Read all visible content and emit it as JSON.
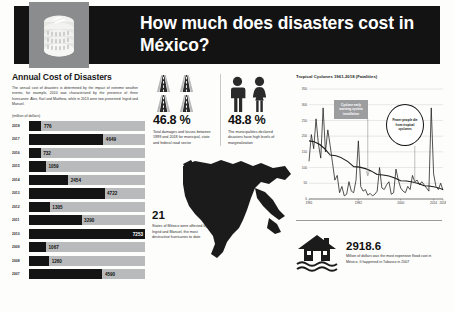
{
  "header": {
    "title": "How much does disasters cost in México?",
    "icon": "coin-stack-icon"
  },
  "left": {
    "section_title": "Annual Cost of Disasters",
    "paragraph": "The annual cost of disasters is determined by the impact of extreme weather events, for example, 2010 was characterized by the presence of three hurricanes: Alex, Karl and Matthew, while in 2013 were two presented: Ingrid and Manuel.",
    "units_label": "(million of dollars)",
    "accent_bar": "#141414",
    "track_color": "#b9babb"
  },
  "chart_data": [
    {
      "type": "bar",
      "title": "Annual Cost of Disasters",
      "ylabel": "",
      "xlabel": "(million of dollars)",
      "orientation": "horizontal",
      "xlim": [
        0,
        7253
      ],
      "grid": false,
      "categories": [
        "2018",
        "2017",
        "2016",
        "2015",
        "2014",
        "2013",
        "2012",
        "2011",
        "2010",
        "2009",
        "2008",
        "2007"
      ],
      "values": [
        776,
        4649,
        732,
        1059,
        2454,
        4722,
        1305,
        3290,
        7253,
        1067,
        1260,
        4590
      ]
    },
    {
      "type": "line",
      "title": "Tropical Cyclones 1961-2018 (Fatalities)",
      "ylabel": "",
      "xlabel": "",
      "ylim": [
        0,
        350
      ],
      "yticks": [
        0,
        50,
        100,
        150,
        200,
        250,
        300,
        350
      ],
      "xticks": [
        "1961",
        "1982",
        "2000",
        "2014",
        "2018"
      ],
      "grid": true,
      "series": [
        {
          "name": "Fatalities",
          "x": [
            1961,
            1962,
            1963,
            1964,
            1965,
            1966,
            1967,
            1968,
            1969,
            1970,
            1971,
            1972,
            1973,
            1974,
            1975,
            1976,
            1977,
            1978,
            1979,
            1980,
            1981,
            1982,
            1983,
            1984,
            1985,
            1986,
            1987,
            1988,
            1989,
            1990,
            1991,
            1992,
            1993,
            1994,
            1995,
            1996,
            1997,
            1998,
            1999,
            2000,
            2001,
            2002,
            2003,
            2004,
            2005,
            2006,
            2007,
            2008,
            2009,
            2010,
            2011,
            2012,
            2013,
            2014,
            2015,
            2016,
            2017,
            2018
          ],
          "values": [
            120,
            205,
            160,
            255,
            175,
            130,
            290,
            150,
            220,
            170,
            115,
            60,
            75,
            20,
            40,
            10,
            15,
            55,
            25,
            20,
            60,
            185,
            40,
            25,
            30,
            12,
            18,
            10,
            15,
            25,
            100,
            35,
            30,
            45,
            55,
            15,
            20,
            95,
            60,
            35,
            25,
            20,
            40,
            30,
            75,
            55,
            60,
            45,
            55,
            45,
            35,
            25,
            290,
            80,
            40,
            30,
            50,
            28
          ]
        },
        {
          "name": "Trend",
          "x": [
            1961,
            1970,
            1980,
            1990,
            2000,
            2010,
            2018
          ],
          "values": [
            185,
            140,
            103,
            78,
            58,
            42,
            30
          ]
        }
      ],
      "annotations": [
        {
          "text": "Cyclone early warning system installation",
          "style": "gray-box",
          "x_year": 1986
        },
        {
          "text": "Fewer people die from tropical cyclones",
          "style": "circle",
          "x_year": 2006
        }
      ]
    }
  ],
  "middle": {
    "stats": [
      {
        "icon": "road-icon",
        "value": "46.8 %",
        "caption": "Total damages and losses between 1999 and 2018 for municipal, state and federal road sector"
      },
      {
        "icon": "people-icon",
        "value": "48.8 %",
        "caption": "The municipalities declared disasters have high levels of marginalization"
      }
    ],
    "map": {
      "icon": "mexico-map-icon",
      "value": "21",
      "caption": "States of México were affected by Ingrid and Manuel, the most destructive hurricanes to date"
    }
  },
  "right": {
    "chart_title": "Tropical Cyclones 1961-2018 (Fatalities)",
    "annotation_box": "Cyclone early warning system installation",
    "annotation_circle": "Fewer people die from tropical cyclones",
    "yticks": [
      "350",
      "300",
      "250",
      "200",
      "150",
      "100",
      "50",
      "0"
    ],
    "xticks": [
      "1961",
      "1982",
      "2000",
      "2014",
      "2018"
    ],
    "flood": {
      "icon": "flooded-house-icon",
      "value": "2918.6",
      "caption": "Million of dollars was the most expensive flood cost in México. It happened in Tabasco in 2007"
    }
  }
}
